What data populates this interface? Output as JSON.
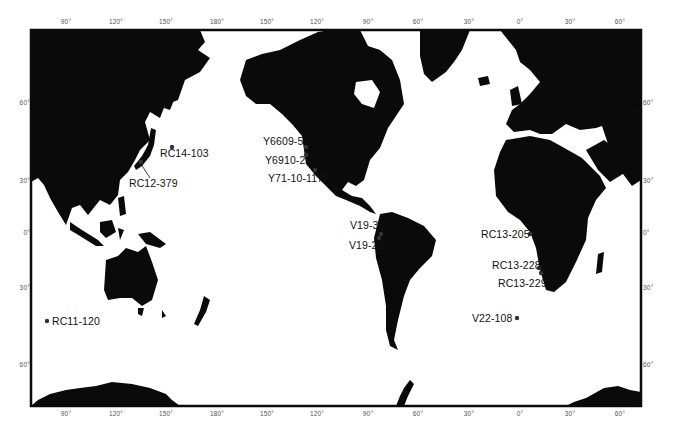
{
  "map": {
    "projection": "Mercator-style world map, Pacific centered",
    "frame": {
      "left": 31,
      "top": 30,
      "right": 641,
      "bottom": 406
    },
    "land_color": "#0a0a0a",
    "ocean_color": "#ffffff",
    "longitude_ticks_top": [
      {
        "label": "90°",
        "x": 66
      },
      {
        "label": "120°",
        "x": 116
      },
      {
        "label": "150°",
        "x": 166
      },
      {
        "label": "180°",
        "x": 217
      },
      {
        "label": "150°",
        "x": 267
      },
      {
        "label": "120°",
        "x": 317
      },
      {
        "label": "90°",
        "x": 368
      },
      {
        "label": "60°",
        "x": 418
      },
      {
        "label": "30°",
        "x": 469
      },
      {
        "label": "0°",
        "x": 520
      },
      {
        "label": "30°",
        "x": 570
      },
      {
        "label": "60°",
        "x": 620
      }
    ],
    "longitude_ticks_bottom": [
      {
        "label": "90°",
        "x": 66
      },
      {
        "label": "120°",
        "x": 116
      },
      {
        "label": "150°",
        "x": 166
      },
      {
        "label": "180°",
        "x": 217
      },
      {
        "label": "150°",
        "x": 267
      },
      {
        "label": "120°",
        "x": 317
      },
      {
        "label": "90°",
        "x": 368
      },
      {
        "label": "60°",
        "x": 418
      },
      {
        "label": "30°",
        "x": 469
      },
      {
        "label": "0°",
        "x": 520
      },
      {
        "label": "30°",
        "x": 570
      },
      {
        "label": "60°",
        "x": 620
      }
    ],
    "latitude_ticks_left": [
      {
        "label": "60°",
        "y": 102
      },
      {
        "label": "30°",
        "y": 180
      },
      {
        "label": "0°",
        "y": 232
      },
      {
        "label": "30°",
        "y": 287
      },
      {
        "label": "60°",
        "y": 364
      }
    ],
    "latitude_ticks_right": [
      {
        "label": "60°",
        "y": 102
      },
      {
        "label": "30°",
        "y": 180
      },
      {
        "label": "0°",
        "y": 232
      },
      {
        "label": "30°",
        "y": 287
      },
      {
        "label": "60°",
        "y": 364
      }
    ],
    "stations": [
      {
        "id": "RC14-103",
        "label": "RC14-103",
        "dot": [
          172,
          147
        ],
        "label_pos": [
          160,
          153
        ]
      },
      {
        "id": "RC12-379",
        "label": "RC12-379",
        "dot": [
          141,
          162
        ],
        "label_pos": [
          129,
          178
        ]
      },
      {
        "id": "Y6609-5",
        "label": "Y6609-5",
        "dot": [
          306,
          147
        ],
        "label_pos": [
          263,
          139
        ]
      },
      {
        "id": "Y6910-2",
        "label": "Y6910-2",
        "dot": [
          306,
          155
        ],
        "label_pos": [
          265,
          155
        ]
      },
      {
        "id": "Y71-10-117P",
        "label": "Y71-10-117P",
        "dot": [
          315,
          170
        ],
        "label_pos": [
          268,
          172
        ]
      },
      {
        "id": "V19-30",
        "label": "V19-30",
        "dot": [
          381,
          234
        ],
        "label_pos": [
          350,
          219
        ]
      },
      {
        "id": "V19-29",
        "label": "V19-29",
        "dot": [
          379,
          237
        ],
        "label_pos": [
          349,
          240
        ]
      },
      {
        "id": "RC13-205",
        "label": "RC13-205",
        "dot": [
          530,
          234
        ],
        "label_pos": [
          480,
          229
        ]
      },
      {
        "id": "RC13-228",
        "label": "RC13-228",
        "dot": [
          539,
          268
        ],
        "label_pos": [
          492,
          260
        ]
      },
      {
        "id": "RC13-229",
        "label": "RC13-229",
        "dot": [
          541,
          273
        ],
        "label_pos": [
          498,
          278
        ]
      },
      {
        "id": "RC11-120",
        "label": "RC11-120",
        "dot": [
          47,
          321
        ],
        "label_pos": [
          53,
          315
        ]
      },
      {
        "id": "V22-108",
        "label": "V22-108",
        "dot": [
          517,
          318
        ],
        "label_pos": [
          472,
          312
        ]
      }
    ]
  }
}
